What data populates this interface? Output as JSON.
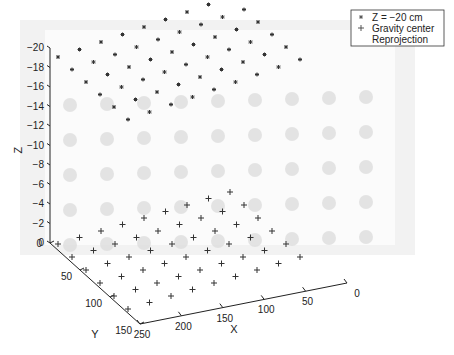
{
  "chart_data": {
    "type": "scatter",
    "title": "",
    "xlabel": "X",
    "ylabel": "Y",
    "zlabel": "Z",
    "x_ticks": [
      "0",
      "50",
      "100",
      "150",
      "200",
      "250"
    ],
    "y_ticks": [
      "0",
      "50",
      "100",
      "150"
    ],
    "z_ticks": [
      "-20",
      "-18",
      "-16",
      "-14",
      "-12",
      "-10",
      "-8",
      "-6",
      "-4",
      "-2",
      "0"
    ],
    "xlim": [
      0,
      250
    ],
    "ylim": [
      0,
      150
    ],
    "zlim": [
      -20,
      0
    ],
    "grid": false,
    "legend_position": "top-right",
    "legend": [
      {
        "marker": "*",
        "label": "Z = −20 cm"
      },
      {
        "marker": "+",
        "label": "Gravity center"
      },
      {
        "marker": "",
        "label": "Reprojection"
      }
    ],
    "series": [
      {
        "name": "Z = −20 cm",
        "marker": "asterisk",
        "z": -20,
        "grid_cols": 9,
        "grid_rows": 6
      },
      {
        "name": "Gravity center",
        "marker": "plus",
        "z": 0,
        "grid_cols": 9,
        "grid_rows": 6
      },
      {
        "name": "Reprojection",
        "marker": "none",
        "description": "background calibration image with grid of blurred dots"
      }
    ]
  },
  "legend": {
    "item1": "Z = −20 cm",
    "item2": "Gravity center",
    "item3": "Reprojection"
  },
  "axes": {
    "x_label": "X",
    "y_label": "Y",
    "z_label": "Z",
    "z_ticks": [
      "−20",
      "−18",
      "−16",
      "−14",
      "−12",
      "−10",
      "−8",
      "−6",
      "−4",
      "−2",
      "0"
    ],
    "y_ticks": [
      "0",
      "50",
      "100",
      "150"
    ],
    "x_ticks": [
      "250",
      "200",
      "150",
      "100",
      "50",
      "0"
    ]
  },
  "colors": {
    "marker": "#333333",
    "axis": "#222222",
    "background_image": "#ececec",
    "blob": "#d8d8d8"
  }
}
